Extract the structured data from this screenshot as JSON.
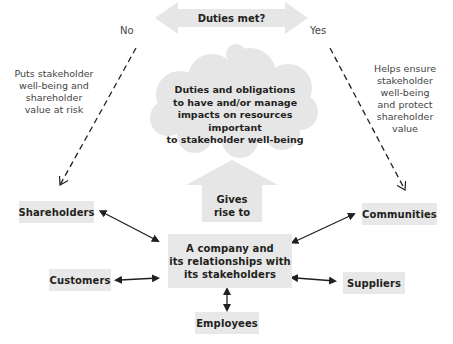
{
  "diagram": {
    "decision": {
      "label": "Duties met?",
      "no_label": "No",
      "yes_label": "Yes"
    },
    "left_outcome": {
      "lines": [
        "Puts stakeholder",
        "well-being and",
        "shareholder",
        "value at risk"
      ]
    },
    "right_outcome": {
      "lines": [
        "Helps ensure",
        "stakeholder",
        "well-being",
        "and protect",
        "shareholder",
        "value"
      ]
    },
    "cloud": {
      "lines": [
        "Duties and obligations",
        "to have and/or manage",
        "impacts on resources important",
        "to stakeholder well-being"
      ]
    },
    "gives_rise": {
      "lines": [
        "Gives",
        "rise to"
      ]
    },
    "center": {
      "lines": [
        "A company and",
        "its relationships with",
        "its stakeholders"
      ]
    },
    "stakeholders": {
      "shareholders": "Shareholders",
      "communities": "Communities",
      "customers": "Customers",
      "suppliers": "Suppliers",
      "employees": "Employees"
    },
    "colors": {
      "box_fill": "#e8e8e8",
      "shape_fill": "#e6e6e6",
      "line": "#231f20",
      "text": "#231f20"
    }
  }
}
